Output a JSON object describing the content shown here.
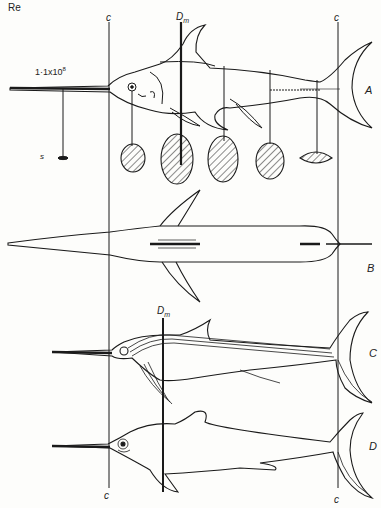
{
  "figure": {
    "labels": {
      "re": "Re",
      "c_top_left": "c",
      "c_top_right": "c",
      "c_bottom_left": "c",
      "c_bottom_right": "c",
      "dm_top": "D",
      "dm_top_sub": "m",
      "dm_mid": "D",
      "dm_mid_sub": "m",
      "re_value": "1·1x10",
      "re_exponent": "8",
      "s": "s",
      "panel_a": "A",
      "panel_b": "B",
      "panel_c": "C",
      "panel_d": "D"
    },
    "panels": [
      {
        "id": "A",
        "view": "lateral, with cross-sections"
      },
      {
        "id": "B",
        "view": "dorsal"
      },
      {
        "id": "C",
        "view": "lateral, lateral-line canals"
      },
      {
        "id": "D",
        "view": "lateral, outline"
      }
    ],
    "colors": {
      "ink": "#1a1a1a",
      "paper": "#fdfdfb"
    }
  }
}
